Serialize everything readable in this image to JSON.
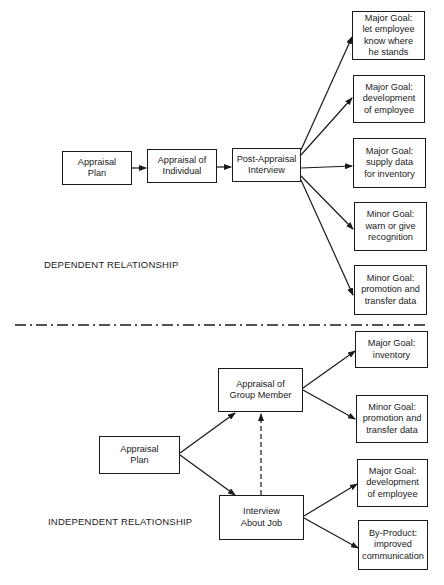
{
  "dependent": {
    "section_label": "DEPENDENT RELATIONSHIP",
    "flow": [
      {
        "id": "dep-appraisal-plan",
        "lines": [
          "Appraisal",
          "Plan"
        ]
      },
      {
        "id": "dep-appraisal-individual",
        "lines": [
          "Appraisal of",
          "Individual"
        ]
      },
      {
        "id": "dep-post-appraisal-interview",
        "lines": [
          "Post-Appraisal",
          "Interview"
        ]
      }
    ],
    "goals": [
      {
        "lines": [
          "Major Goal:",
          "let employee",
          "know where",
          "he stands"
        ]
      },
      {
        "lines": [
          "Major Goal:",
          "development",
          "of employee"
        ]
      },
      {
        "lines": [
          "Major Goal:",
          "supply data",
          "for inventory"
        ]
      },
      {
        "lines": [
          "Minor Goal:",
          "warn or give",
          "recognition"
        ]
      },
      {
        "lines": [
          "Minor Goal:",
          "promotion and",
          "transfer data"
        ]
      }
    ]
  },
  "independent": {
    "section_label": "INDEPENDENT RELATIONSHIP",
    "appraisal_plan": {
      "lines": [
        "Appraisal",
        "Plan"
      ]
    },
    "appraisal_group_member": {
      "lines": [
        "Appraisal of",
        "Group Member"
      ]
    },
    "interview_about_job": {
      "lines": [
        "Interview",
        "About Job"
      ]
    },
    "goals": [
      {
        "lines": [
          "Major Goal:",
          "inventory"
        ]
      },
      {
        "lines": [
          "Minor Goal:",
          "promotion and",
          "transfer data"
        ]
      },
      {
        "lines": [
          "Major Goal:",
          "development",
          "of employee"
        ]
      },
      {
        "lines": [
          "By-Product:",
          "improved",
          "communication"
        ]
      }
    ]
  },
  "colors": {
    "ink": "#1a1a1a",
    "background": "#ffffff"
  }
}
